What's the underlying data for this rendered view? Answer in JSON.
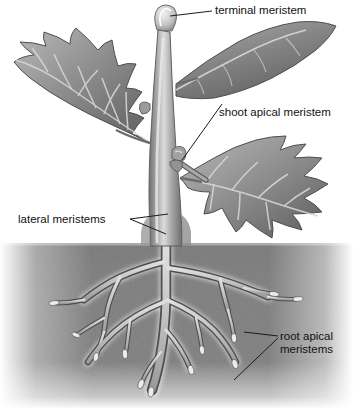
{
  "figure": {
    "type": "botanical-diagram",
    "style": "grayscale shaded illustration",
    "background_color": "#ffffff"
  },
  "labels": {
    "terminal": "terminal meristem",
    "shoot_apical": "shoot apical meristem",
    "lateral": "lateral meristems",
    "root_apical_line1": "root apical",
    "root_apical_line2": "meristems"
  },
  "colors": {
    "text": "#111111",
    "leader_line": "#1a1a1a",
    "soil_dark": "#6f6f6f",
    "soil_mid": "#8a8a8a",
    "stem_light": "#cfcfcf",
    "stem_mid": "#9a9a9a",
    "stem_dark": "#6a6a6a",
    "leaf_light": "#b8b8b8",
    "leaf_mid": "#8d8d8d",
    "leaf_dark": "#5f5f5f",
    "vein": "#d8d8d8",
    "root_core": "#c8c8c8",
    "root_edge": "#4a4a4a",
    "bud_highlight": "#efefef"
  },
  "structures": {
    "leaves": [
      {
        "name": "upper-left-leaf",
        "position": "left",
        "view": "broad"
      },
      {
        "name": "upper-right-leaf",
        "position": "upper right",
        "view": "edge-on crescent"
      },
      {
        "name": "lower-right-leaf",
        "position": "lower right",
        "view": "broad"
      }
    ],
    "stem": {
      "name": "main-stem",
      "orientation": "vertical"
    },
    "terminal_bud": {
      "name": "terminal-bud",
      "location": "stem apex"
    },
    "axillary_bud": {
      "name": "axillary-bud",
      "location": "leaf axil"
    },
    "soil": {
      "name": "soil-band",
      "top_y": 243
    },
    "roots": {
      "name": "root-system",
      "tip_count": 9
    }
  }
}
